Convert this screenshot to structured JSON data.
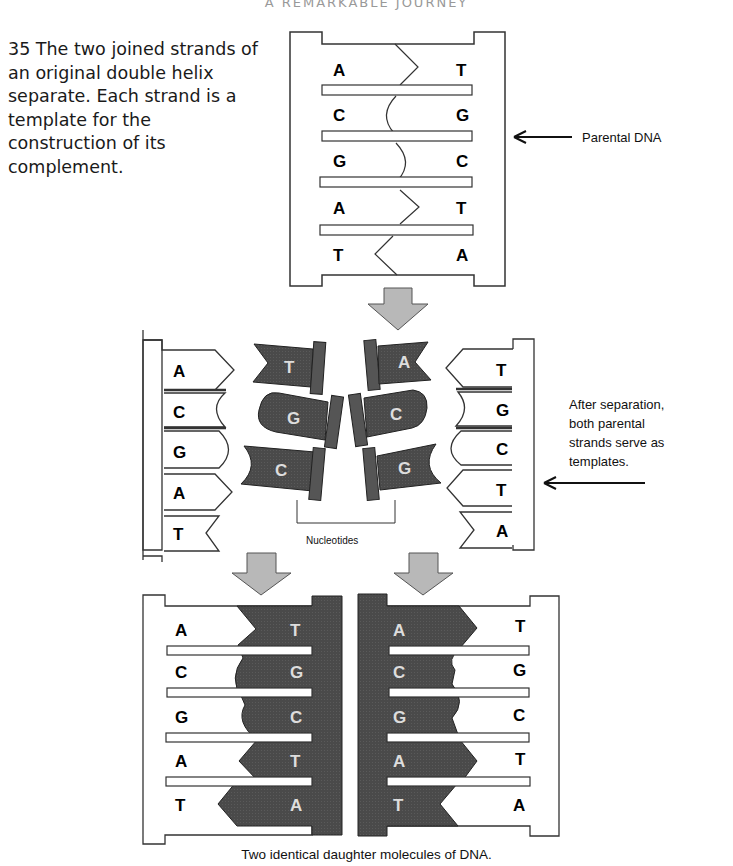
{
  "header": {
    "running_title": "A REMARKABLE JOURNEY"
  },
  "caption": {
    "figure_number": "35",
    "text": "35 The two joined strands of an original double helix separate. Each strand is a template for the construction of its complement."
  },
  "parental_dna": {
    "label": "Parental DNA",
    "left_bases": [
      "A",
      "C",
      "G",
      "A",
      "T"
    ],
    "right_bases": [
      "T",
      "G",
      "C",
      "T",
      "A"
    ]
  },
  "separation": {
    "left_template_bases": [
      "A",
      "C",
      "G",
      "A",
      "T"
    ],
    "right_template_bases": [
      "T",
      "G",
      "C",
      "T",
      "A"
    ],
    "free_nucleotides_left": [
      "T",
      "G",
      "C"
    ],
    "free_nucleotides_right": [
      "A",
      "C",
      "G"
    ],
    "nucleotides_label": "Nucleotides",
    "note": "After separation, both parental strands serve as templates.",
    "note_lines": [
      "After separation,",
      "both parental",
      "strands serve as",
      "templates."
    ]
  },
  "daughters": {
    "left": {
      "parental_bases": [
        "A",
        "C",
        "G",
        "A",
        "T"
      ],
      "new_bases": [
        "T",
        "G",
        "C",
        "T",
        "A"
      ]
    },
    "right": {
      "new_bases": [
        "A",
        "C",
        "G",
        "A",
        "T"
      ],
      "parental_bases": [
        "T",
        "G",
        "C",
        "T",
        "A"
      ]
    },
    "caption": "Two identical daughter molecules of DNA."
  },
  "colors": {
    "new_strand": "#4a4a4a",
    "arrow_fill": "#b8b8b8",
    "outline": "#333333"
  }
}
